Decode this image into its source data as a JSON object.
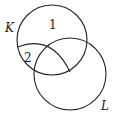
{
  "diagram": {
    "type": "venn",
    "sets": [
      {
        "name": "K"
      },
      {
        "name": "L"
      }
    ],
    "region_labels": [
      "1",
      "2"
    ],
    "stroke_color": "#222222"
  }
}
